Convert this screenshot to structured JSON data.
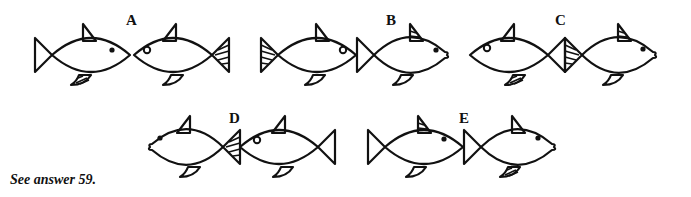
{
  "labels": {
    "A": "A",
    "B": "B",
    "C": "C",
    "D": "D",
    "E": "E"
  },
  "caption": "See answer 59.",
  "pairs": [
    {
      "label": "A",
      "fish": [
        {
          "faces": "right",
          "eye": "filled",
          "tail": "plain",
          "dorsal": "plain",
          "pectoral": "striped",
          "lips": false
        },
        {
          "faces": "left",
          "eye": "hollow",
          "tail": "striped",
          "dorsal": "plain",
          "pectoral": "plain",
          "lips": false
        }
      ]
    },
    {
      "label": "B",
      "fish": [
        {
          "faces": "right",
          "eye": "hollow",
          "tail": "striped",
          "dorsal": "plain",
          "pectoral": "plain",
          "lips": false
        },
        {
          "faces": "right",
          "eye": "filled",
          "tail": "plain",
          "dorsal": "striped",
          "pectoral": "plain",
          "lips": true
        }
      ]
    },
    {
      "label": "C",
      "fish": [
        {
          "faces": "left",
          "eye": "hollow",
          "tail": "plain",
          "dorsal": "plain",
          "pectoral": "striped",
          "lips": false
        },
        {
          "faces": "right",
          "eye": "filled",
          "tail": "striped",
          "dorsal": "striped",
          "pectoral": "plain",
          "lips": true
        }
      ]
    },
    {
      "label": "D",
      "fish": [
        {
          "faces": "left",
          "eye": "filled",
          "tail": "striped",
          "dorsal": "plain",
          "pectoral": "plain",
          "lips": true
        },
        {
          "faces": "left",
          "eye": "hollow",
          "tail": "plain",
          "dorsal": "plain",
          "pectoral": "plain",
          "lips": false
        }
      ]
    },
    {
      "label": "E",
      "fish": [
        {
          "faces": "right",
          "eye": "filled",
          "tail": "plain",
          "dorsal": "striped",
          "pectoral": "plain",
          "lips": false
        },
        {
          "faces": "right",
          "eye": "filled",
          "tail": "plain",
          "dorsal": "plain",
          "pectoral": "striped",
          "lips": true
        }
      ]
    }
  ]
}
